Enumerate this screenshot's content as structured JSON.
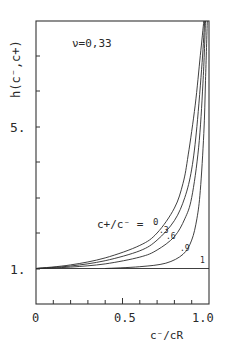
{
  "chart_data": {
    "type": "line",
    "title": "",
    "annotation": "ν=0,33",
    "xlabel": "c⁻/cR",
    "ylabel": "h(c⁻,c+)",
    "xlim": [
      0,
      1.0
    ],
    "ylim": [
      0,
      8
    ],
    "x_tick_labels": [
      "0",
      "0.5",
      "1.0"
    ],
    "x_minor_ticks": [
      0.1,
      0.2,
      0.3,
      0.4,
      0.6,
      0.7,
      0.8,
      0.9
    ],
    "y_tick_labels": [
      "1.",
      "5."
    ],
    "y_minor_ticks": [
      2,
      3,
      4,
      6,
      7
    ],
    "grid": false,
    "legend_title": "c+/c⁻ =",
    "series": [
      {
        "name": "0",
        "label": "0",
        "x": [
          0,
          0.2,
          0.4,
          0.6,
          0.7,
          0.8,
          0.85,
          0.88,
          0.92,
          0.95,
          0.97
        ],
        "y": [
          1,
          1.1,
          1.3,
          1.65,
          2.0,
          2.7,
          3.4,
          4.2,
          5.6,
          7.0,
          8.0
        ]
      },
      {
        "name": "0.3",
        "label": ".3",
        "x": [
          0,
          0.2,
          0.4,
          0.6,
          0.7,
          0.8,
          0.86,
          0.9,
          0.93,
          0.96,
          0.975
        ],
        "y": [
          1,
          1.07,
          1.22,
          1.5,
          1.8,
          2.35,
          3.0,
          3.8,
          5.0,
          6.8,
          8.0
        ]
      },
      {
        "name": "0.6",
        "label": ".6",
        "x": [
          0,
          0.2,
          0.4,
          0.6,
          0.7,
          0.8,
          0.86,
          0.9,
          0.94,
          0.965,
          0.98
        ],
        "y": [
          1,
          1.04,
          1.13,
          1.32,
          1.52,
          1.9,
          2.4,
          3.0,
          4.4,
          6.2,
          8.0
        ]
      },
      {
        "name": "0.9",
        "label": ".9",
        "x": [
          0.4,
          0.6,
          0.75,
          0.85,
          0.9,
          0.93,
          0.95,
          0.97,
          0.98,
          0.99
        ],
        "y": [
          1,
          1.05,
          1.15,
          1.4,
          1.8,
          2.4,
          3.2,
          4.8,
          6.3,
          8.0
        ]
      },
      {
        "name": "1",
        "label": "1",
        "x": [
          0,
          1.0
        ],
        "y": [
          1,
          1
        ]
      }
    ]
  }
}
